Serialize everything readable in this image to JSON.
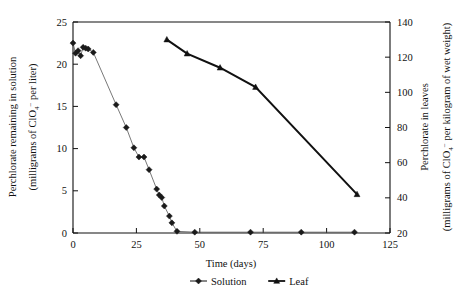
{
  "chart_data": {
    "type": "line",
    "title": "",
    "xlabel": "Time  (days)",
    "xlim": [
      0,
      125
    ],
    "xticks": [
      0,
      25,
      50,
      75,
      100,
      125
    ],
    "grid": false,
    "legend_position": "bottom-center",
    "axes": [
      {
        "id": "left",
        "label_line1": "Perchlorate remaining in solution",
        "label_line2_prefix": "(milligrams of ClO",
        "label_line2_sub": "4",
        "label_line2_sup": "−",
        "label_line2_suffix": " per liter)",
        "lim": [
          0,
          25
        ],
        "ticks": [
          0,
          5,
          10,
          15,
          20,
          25
        ]
      },
      {
        "id": "right",
        "label_line1": "Perchlorate in leaves",
        "label_line2_prefix": "(milligrams of ClO",
        "label_line2_sub": "4",
        "label_line2_sup": "−",
        "label_line2_suffix": " per kilogram of wet weight)",
        "lim": [
          20,
          140
        ],
        "ticks": [
          20,
          40,
          60,
          80,
          100,
          120,
          140
        ]
      }
    ],
    "series": [
      {
        "name": "Solution",
        "axis": "left",
        "marker": "diamond",
        "line_style": "thin",
        "color": "#1a1a1a",
        "points": [
          {
            "x": 0,
            "y": 22.5
          },
          {
            "x": 1,
            "y": 21.3
          },
          {
            "x": 2,
            "y": 21.6
          },
          {
            "x": 3,
            "y": 21.0
          },
          {
            "x": 4,
            "y": 22.0
          },
          {
            "x": 5,
            "y": 21.9
          },
          {
            "x": 6,
            "y": 21.8
          },
          {
            "x": 8,
            "y": 21.4
          },
          {
            "x": 17,
            "y": 15.2
          },
          {
            "x": 21,
            "y": 12.5
          },
          {
            "x": 24,
            "y": 10.1
          },
          {
            "x": 26,
            "y": 9.0
          },
          {
            "x": 28,
            "y": 9.0
          },
          {
            "x": 30,
            "y": 7.5
          },
          {
            "x": 33,
            "y": 5.2
          },
          {
            "x": 34,
            "y": 4.5
          },
          {
            "x": 35,
            "y": 4.2
          },
          {
            "x": 36,
            "y": 3.2
          },
          {
            "x": 38,
            "y": 2.0
          },
          {
            "x": 39,
            "y": 1.2
          },
          {
            "x": 41,
            "y": 0.2
          },
          {
            "x": 48,
            "y": 0.1
          },
          {
            "x": 70,
            "y": 0.1
          },
          {
            "x": 90,
            "y": 0.1
          },
          {
            "x": 111,
            "y": 0.1
          }
        ]
      },
      {
        "name": "Leaf",
        "axis": "right",
        "marker": "triangle",
        "line_style": "thick",
        "color": "#111111",
        "points": [
          {
            "x": 37,
            "y": 130
          },
          {
            "x": 45,
            "y": 122
          },
          {
            "x": 58,
            "y": 114
          },
          {
            "x": 72,
            "y": 103
          },
          {
            "x": 112,
            "y": 42
          }
        ]
      }
    ],
    "legend": [
      {
        "label": "Solution",
        "marker": "diamond"
      },
      {
        "label": "Leaf",
        "marker": "triangle"
      }
    ]
  }
}
